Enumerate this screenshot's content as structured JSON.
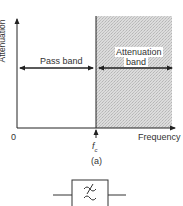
{
  "diagram": {
    "y_axis_label": "Attenuation",
    "x_axis_label": "Frequency",
    "origin_label": "0",
    "cutoff_label": "f",
    "cutoff_subscript": "c",
    "pass_band_label": "Pass band",
    "attenuation_band_label_line1": "Attenuation",
    "attenuation_band_label_line2": "band",
    "caption": "(a)",
    "filter_symbol": "low-pass-filter-symbol",
    "colors": {
      "line": "#222222",
      "shade": "#d4d4d4",
      "shade_dot": "#b8b8b8"
    }
  }
}
